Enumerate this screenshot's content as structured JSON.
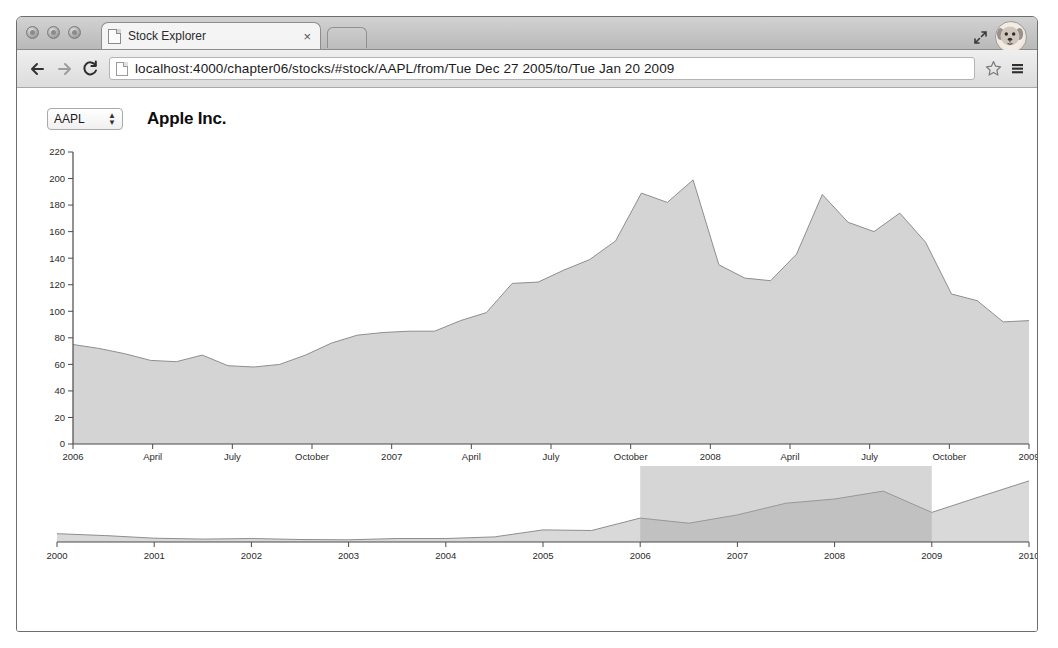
{
  "browser": {
    "window_controls": [
      "close",
      "minimize",
      "maximize"
    ],
    "tab": {
      "title": "Stock Explorer",
      "close_label": "×",
      "favicon": "page-icon"
    },
    "new_tab_label": "+",
    "toolbar": {
      "back_label": "←",
      "forward_label": "→",
      "reload_label": "⟳",
      "url": "localhost:4000/chapter06/stocks/#stock/AAPL/from/Tue Dec 27 2005/to/Tue Jan 20 2009",
      "url_placeholder": "Search or type URL",
      "bookmark_label": "☆",
      "menu_label": "☰"
    },
    "expand_icon": "expand-arrows-icon",
    "avatar_icon": "dog-avatar-icon"
  },
  "app": {
    "ticker": {
      "selected": "AAPL",
      "options": [
        "AAPL"
      ],
      "stepper_glyph": "↕"
    },
    "company_name": "Apple Inc.",
    "colors": {
      "area_fill": "#d4d4d4",
      "area_stroke": "#8e8e8e",
      "axis": "#4a4a4a",
      "brush": "#a4a4a4",
      "text": "#2b2b2b"
    }
  },
  "chart_data": [
    {
      "id": "main-chart",
      "type": "area",
      "title": "Apple Inc.",
      "xlabel": "",
      "ylabel": "",
      "ylim": [
        0,
        220
      ],
      "yticks": [
        0,
        20,
        40,
        60,
        80,
        100,
        120,
        140,
        160,
        180,
        200,
        220
      ],
      "xticks": [
        "2006",
        "April",
        "July",
        "October",
        "2007",
        "April",
        "July",
        "October",
        "2008",
        "April",
        "July",
        "October",
        "2009"
      ],
      "grid": false,
      "legend": "none",
      "x_range": [
        "Tue Dec 27 2005",
        "Tue Jan 20 2009"
      ],
      "x": [
        "2005-12",
        "2006-01",
        "2006-02",
        "2006-03",
        "2006-04",
        "2006-05",
        "2006-06",
        "2006-07",
        "2006-08",
        "2006-09",
        "2006-10",
        "2006-11",
        "2006-12",
        "2007-01",
        "2007-02",
        "2007-03",
        "2007-04",
        "2007-05",
        "2007-06",
        "2007-07",
        "2007-08",
        "2007-09",
        "2007-10",
        "2007-11",
        "2007-12",
        "2008-01",
        "2008-02",
        "2008-03",
        "2008-04",
        "2008-05",
        "2008-06",
        "2008-07",
        "2008-08",
        "2008-09",
        "2008-10",
        "2008-11",
        "2008-12",
        "2009-01"
      ],
      "values": [
        75,
        72,
        68,
        63,
        62,
        67,
        59,
        58,
        60,
        67,
        76,
        82,
        84,
        85,
        85,
        93,
        99,
        121,
        122,
        131,
        139,
        153,
        189,
        182,
        199,
        135,
        125,
        123,
        143,
        188,
        167,
        160,
        174,
        152,
        113,
        108,
        92,
        93
      ]
    },
    {
      "id": "context-chart",
      "type": "area",
      "title": "",
      "xlabel": "",
      "ylabel": "",
      "xticks": [
        "2000",
        "2001",
        "2002",
        "2003",
        "2004",
        "2005",
        "2006",
        "2007",
        "2008",
        "2009",
        "2010"
      ],
      "grid": false,
      "legend": "none",
      "brush_selection": {
        "from": "2006",
        "to": "2009"
      },
      "x": [
        "2000",
        "2000-06",
        "2001",
        "2001-06",
        "2002",
        "2002-06",
        "2003",
        "2003-06",
        "2004",
        "2004-06",
        "2005",
        "2005-06",
        "2006",
        "2006-06",
        "2007",
        "2007-06",
        "2008",
        "2008-06",
        "2009",
        "2009-06",
        "2010"
      ],
      "values": [
        26,
        20,
        12,
        9,
        11,
        8,
        7,
        11,
        11,
        16,
        38,
        36,
        75,
        59,
        85,
        122,
        135,
        160,
        93,
        143,
        192
      ]
    }
  ]
}
